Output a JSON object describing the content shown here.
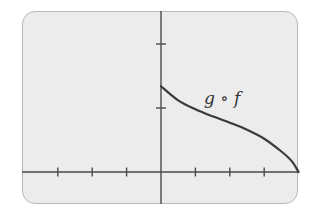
{
  "chart_data": {
    "type": "line",
    "title": "",
    "xlabel": "",
    "ylabel": "",
    "xlim": [
      -4.4,
      4
    ],
    "ylim": [
      -0.5,
      2.5
    ],
    "grid": false,
    "x_ticks": [
      -3,
      -2,
      -1,
      1,
      2,
      3
    ],
    "y_ticks": [
      1,
      2
    ],
    "tick_labels_shown": false,
    "series": [
      {
        "name": "g ∘ f",
        "x": [
          0,
          0.5,
          1,
          1.5,
          2,
          2.5,
          3,
          3.5,
          3.8,
          4
        ],
        "y": [
          1.34,
          1.12,
          0.98,
          0.87,
          0.77,
          0.66,
          0.52,
          0.32,
          0.17,
          0
        ],
        "color": "#3a3a3a"
      }
    ],
    "annotations": [
      {
        "text": "g ∘ f",
        "x": 2.15,
        "y": 1.18
      }
    ]
  },
  "labels": {
    "curve_label": "g ∘ f"
  }
}
